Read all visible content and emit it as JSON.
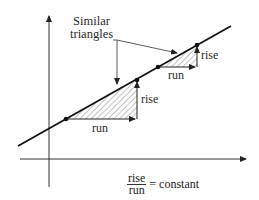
{
  "diagram": {
    "title_line1": "Similar",
    "title_line2": "triangles",
    "big_triangle": {
      "run_label": "run",
      "rise_label": "rise"
    },
    "small_triangle": {
      "run_label": "run",
      "rise_label": "rise"
    },
    "equation": {
      "numerator": "rise",
      "denominator": "run",
      "rhs": "= constant"
    },
    "colors": {
      "stroke": "#222222",
      "hatch": "#555555",
      "background": "#ffffff"
    }
  }
}
